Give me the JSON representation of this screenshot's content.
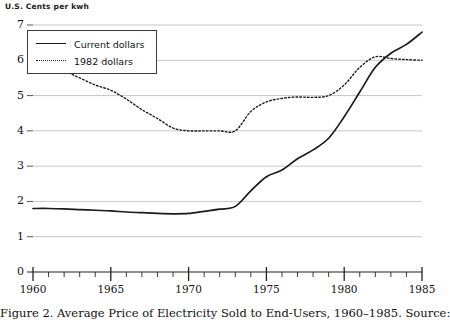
{
  "figure": {
    "y_axis_title": "U.S. Cents per kwh",
    "caption": "Figure 2.  Average Price of Electricity Sold to End-Users, 1960–1985. Source:"
  },
  "legend": {
    "position": "top-left",
    "entries": [
      {
        "label": "Current dollars",
        "style": "solid"
      },
      {
        "label": "1982 dollars",
        "style": "dotted"
      }
    ]
  },
  "chart_data": {
    "type": "line",
    "xlabel": "",
    "ylabel": "U.S. Cents per kwh",
    "xlim": [
      1960,
      1985
    ],
    "ylim": [
      0,
      7
    ],
    "grid": true,
    "y_ticks": [
      0,
      1,
      2,
      3,
      4,
      5,
      6,
      7
    ],
    "x_ticks": [
      1960,
      1965,
      1970,
      1975,
      1980,
      1985
    ],
    "x_minor_tick_interval": 1,
    "x": [
      1960,
      1961,
      1962,
      1963,
      1964,
      1965,
      1966,
      1967,
      1968,
      1969,
      1970,
      1971,
      1972,
      1973,
      1974,
      1975,
      1976,
      1977,
      1978,
      1979,
      1980,
      1981,
      1982,
      1983,
      1984,
      1985
    ],
    "series": [
      {
        "name": "Current dollars",
        "style": "solid",
        "color": "#1a1a1a",
        "values": [
          1.8,
          1.8,
          1.79,
          1.77,
          1.75,
          1.73,
          1.7,
          1.68,
          1.66,
          1.65,
          1.66,
          1.72,
          1.78,
          1.86,
          2.3,
          2.7,
          2.89,
          3.21,
          3.46,
          3.79,
          4.4,
          5.1,
          5.8,
          6.2,
          6.45,
          6.8
        ]
      },
      {
        "name": "1982 dollars",
        "style": "dotted",
        "color": "#1a1a1a",
        "values": [
          6.0,
          5.85,
          5.7,
          5.5,
          5.3,
          5.15,
          4.9,
          4.6,
          4.35,
          4.08,
          4.0,
          4.0,
          4.0,
          4.0,
          4.55,
          4.82,
          4.92,
          4.96,
          4.95,
          5.0,
          5.3,
          5.8,
          6.1,
          6.05,
          6.02,
          6.0
        ]
      }
    ]
  },
  "axis_labels": {
    "y": [
      "7",
      "6",
      "5",
      "4",
      "3",
      "2",
      "1",
      "0"
    ],
    "x": [
      "1960",
      "1965",
      "1970",
      "1975",
      "1980",
      "1985"
    ]
  }
}
